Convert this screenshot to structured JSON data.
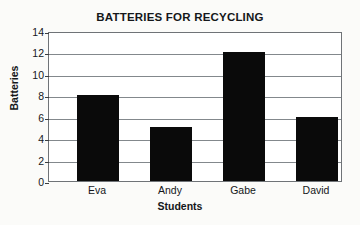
{
  "chart_data": {
    "type": "bar",
    "title": "BATTERIES FOR RECYCLING",
    "xlabel": "Students",
    "ylabel": "Batteries",
    "categories": [
      "Eva",
      "Andy",
      "Gabe",
      "David"
    ],
    "values": [
      8,
      5,
      12,
      6
    ],
    "ylim": [
      0,
      14
    ],
    "y_ticks": [
      0,
      2,
      4,
      6,
      8,
      10,
      12,
      14
    ],
    "y_tick_labels": [
      "0",
      "2",
      "4",
      "6",
      "8",
      "10",
      "12",
      "14"
    ],
    "grid": true,
    "legend": null,
    "bar_color": "#0a0a0a",
    "plot_background": "#ffffff",
    "page_background": "#fbfbf9",
    "grid_color": "#83888c"
  }
}
